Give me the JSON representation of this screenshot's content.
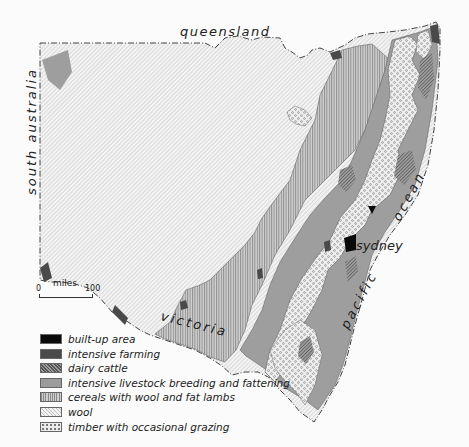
{
  "map": {
    "labels": {
      "queensland": "queensland",
      "south_australia": "south australia",
      "victoria": "victoria",
      "pacific": "pacific",
      "ocean": "ocean",
      "sydney": "sydney"
    },
    "scale": {
      "unit": "miles",
      "start": "0",
      "end": "100"
    }
  },
  "legend": {
    "items": [
      {
        "key": "builtup",
        "label": "built-up area",
        "color": "#0a0a0a"
      },
      {
        "key": "intensive",
        "label": "intensive farming",
        "color": "#4a4a4a"
      },
      {
        "key": "dairy",
        "label": "dairy cattle",
        "pattern": "dense diagonal hatch"
      },
      {
        "key": "livestock",
        "label": "intensive livestock breeding and fattening",
        "color": "#9c9c9c"
      },
      {
        "key": "cereals",
        "label": "cereals with wool and fat lambs",
        "pattern": "vertical hatch"
      },
      {
        "key": "wool",
        "label": "wool",
        "pattern": "light diagonal hatch"
      },
      {
        "key": "timber",
        "label": "timber with occasional grazing",
        "pattern": "dotted circles"
      }
    ]
  }
}
